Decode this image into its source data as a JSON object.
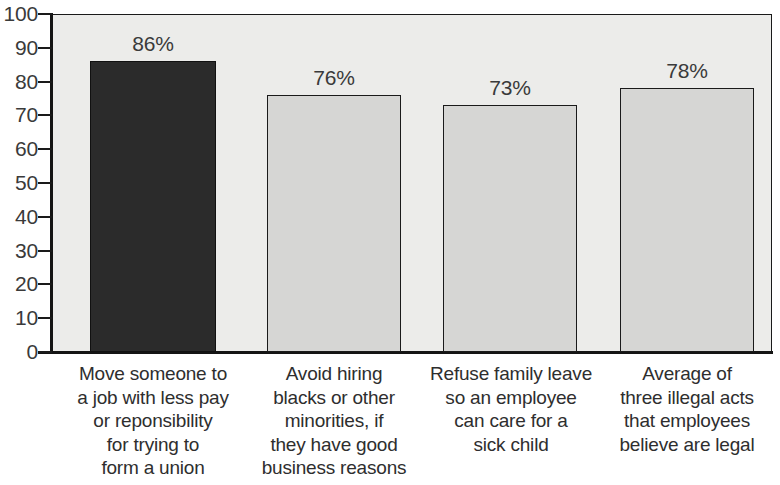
{
  "chart_data": {
    "type": "bar",
    "title": "",
    "xlabel": "",
    "ylabel": "",
    "ylim": [
      0,
      100
    ],
    "ytick_step": 10,
    "grid": false,
    "legend": "none",
    "categories": [
      "Move someone to a job with less pay or reponsibility for trying to form a union",
      "Avoid hiring blacks or other minorities, if they have good business reasons",
      "Refuse family leave so an employee can care for a sick child",
      "Average of three illegal acts that employees believe are legal"
    ],
    "category_lines": [
      [
        "Move someone to",
        "a job with less pay",
        "or reponsibility",
        "for trying to",
        "form a union"
      ],
      [
        "Avoid hiring",
        "blacks or other",
        "minorities, if",
        "they have good",
        "business reasons"
      ],
      [
        "Refuse family leave",
        "so an employee",
        "can care for a",
        "sick child"
      ],
      [
        "Average of",
        "three illegal acts",
        "that employees",
        "believe are legal"
      ]
    ],
    "values": [
      86,
      76,
      73,
      78
    ],
    "value_labels": [
      "86%",
      "76%",
      "73%",
      "78%"
    ],
    "ytick_labels": [
      "100",
      "90",
      "80",
      "70",
      "60",
      "50",
      "40",
      "30",
      "20",
      "10",
      "0"
    ],
    "bar_colors": [
      "#2b2b2b",
      "#d6d6d4",
      "#d6d6d4",
      "#d6d6d4"
    ],
    "plot_background": "#ececea",
    "axis_color": "#141414"
  },
  "title_remnant": ""
}
